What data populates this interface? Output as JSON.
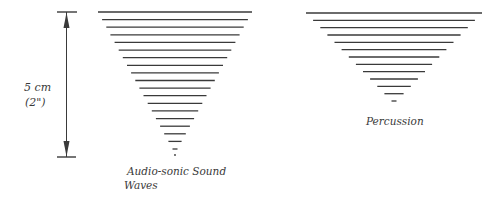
{
  "diagram": {
    "measure": {
      "value_label": "5 cm",
      "alt_label": "(2\")"
    },
    "figures": [
      {
        "id": "audio-sonic",
        "caption_lines": [
          "Audio-sonic Sound",
          "Waves"
        ],
        "line_count": 19,
        "ends_with_dot": true
      },
      {
        "id": "percussion",
        "caption_lines": [
          "Percussion"
        ],
        "line_count": 13,
        "ends_with_dot": false
      }
    ],
    "colors": {
      "ink": "#3a3a3a",
      "background": "#ffffff"
    }
  }
}
